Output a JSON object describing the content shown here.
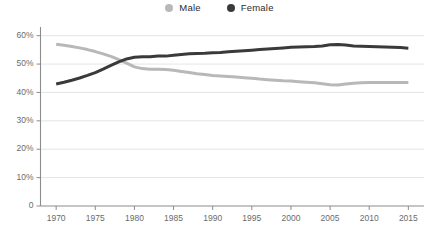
{
  "legend": {
    "position": "top-center",
    "entries": [
      {
        "label": "Male",
        "color": "#b8b8b8",
        "marker": "circle-dot-icon"
      },
      {
        "label": "Female",
        "color": "#3a3a3a",
        "marker": "circle-dot-icon"
      }
    ]
  },
  "axes": {
    "y_ticks": [
      "0",
      "10%",
      "20%",
      "30%",
      "40%",
      "50%",
      "60%"
    ],
    "x_ticks": [
      "1970",
      "1975",
      "1980",
      "1985",
      "1990",
      "1995",
      "2000",
      "2005",
      "2010",
      "2015"
    ]
  },
  "colors": {
    "male_line": "#b8b8b8",
    "female_line": "#3a3a3a",
    "gridline": "#d9d9d9",
    "axis": "#8c8c8c",
    "tick_text": "#6b6b6b",
    "legend_text": "#2c2c2c",
    "background": "#ffffff"
  },
  "chart_data": {
    "type": "line",
    "title": "",
    "subtitle": "",
    "xlabel": "",
    "ylabel": "",
    "xlim": [
      1968,
      2017
    ],
    "ylim": [
      0,
      62
    ],
    "grid": true,
    "y_tick_values": [
      0,
      10,
      20,
      30,
      40,
      50,
      60
    ],
    "y_tick_labels": [
      "0",
      "10%",
      "20%",
      "30%",
      "40%",
      "50%",
      "60%"
    ],
    "x_tick_values": [
      1970,
      1975,
      1980,
      1985,
      1990,
      1995,
      2000,
      2005,
      2010,
      2015
    ],
    "x_tick_labels": [
      "1970",
      "1975",
      "1980",
      "1985",
      "1990",
      "1995",
      "2000",
      "2005",
      "2010",
      "2015"
    ],
    "legend_position": "top-center",
    "x": [
      1970,
      1971,
      1972,
      1973,
      1974,
      1975,
      1976,
      1977,
      1978,
      1979,
      1980,
      1981,
      1982,
      1983,
      1984,
      1985,
      1986,
      1987,
      1988,
      1989,
      1990,
      1991,
      1992,
      1993,
      1994,
      1995,
      1996,
      1997,
      1998,
      1999,
      2000,
      2001,
      2002,
      2003,
      2004,
      2005,
      2006,
      2007,
      2008,
      2009,
      2010,
      2011,
      2012,
      2013,
      2014,
      2015
    ],
    "series": [
      {
        "name": "Male",
        "color": "#b8b8b8",
        "values": [
          57.0,
          56.6,
          56.2,
          55.7,
          55.1,
          54.4,
          53.6,
          52.7,
          51.6,
          50.3,
          49.0,
          48.4,
          48.2,
          48.2,
          48.1,
          47.8,
          47.4,
          47.0,
          46.6,
          46.3,
          46.0,
          45.8,
          45.6,
          45.4,
          45.2,
          45.0,
          44.7,
          44.5,
          44.3,
          44.1,
          44.0,
          43.8,
          43.6,
          43.4,
          43.1,
          42.7,
          42.6,
          43.0,
          43.2,
          43.4,
          43.5,
          43.5,
          43.5,
          43.5,
          43.5,
          43.5
        ]
      },
      {
        "name": "Female",
        "color": "#3a3a3a",
        "values": [
          43.0,
          43.6,
          44.3,
          45.1,
          46.0,
          47.0,
          48.2,
          49.5,
          50.8,
          51.8,
          52.4,
          52.6,
          52.6,
          52.8,
          52.8,
          53.1,
          53.4,
          53.6,
          53.7,
          53.8,
          54.0,
          54.1,
          54.3,
          54.5,
          54.7,
          54.9,
          55.1,
          55.3,
          55.5,
          55.7,
          55.9,
          56.0,
          56.1,
          56.2,
          56.4,
          56.8,
          56.9,
          56.7,
          56.4,
          56.3,
          56.2,
          56.1,
          56.0,
          55.9,
          55.8,
          55.6
        ]
      }
    ]
  }
}
